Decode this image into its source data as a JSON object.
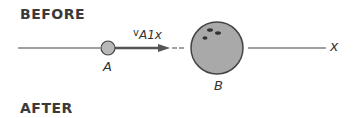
{
  "sections": {
    "before": "BEFORE",
    "after": "AFTER"
  },
  "objects": {
    "a": {
      "label": "A",
      "color": "#b8b8b8"
    },
    "b": {
      "label": "B",
      "color": "#a9a9a9"
    }
  },
  "velocity": {
    "symbol": "v",
    "subscript": "A1x"
  },
  "axis": {
    "label": "x"
  }
}
